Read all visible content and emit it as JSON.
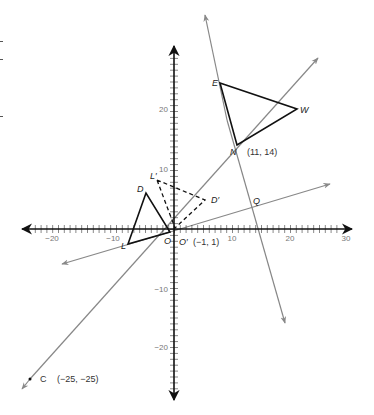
{
  "diagram": {
    "type": "coordinate-plane-transformations",
    "colors": {
      "axis": "#111111",
      "ray": "#888888",
      "triangle": "#111111",
      "dashed_triangle": "#111111",
      "tick_label": "#777777",
      "label": "#222222"
    },
    "axes": {
      "x_ticks": [
        {
          "value": -20,
          "label": "−20"
        },
        {
          "value": -10,
          "label": "−10"
        },
        {
          "value": 10,
          "label": "10"
        },
        {
          "value": 20,
          "label": "20"
        },
        {
          "value": 30,
          "label": "30"
        }
      ],
      "y_ticks": [
        {
          "value": 20,
          "label": "20"
        },
        {
          "value": 10,
          "label": "10"
        },
        {
          "value": -10,
          "label": "−10"
        },
        {
          "value": -20,
          "label": "−20"
        }
      ]
    },
    "points": {
      "E": {
        "label": "E"
      },
      "W": {
        "label": "W"
      },
      "N": {
        "label": "N",
        "coords": "(11, 14)"
      },
      "Q": {
        "label": "Q"
      },
      "D": {
        "label": "D"
      },
      "L": {
        "label": "L"
      },
      "O": {
        "label": "O"
      },
      "D_prime": {
        "label": "D′"
      },
      "L_prime": {
        "label": "L′"
      },
      "O_prime": {
        "label": "O′",
        "coords": "(−1, 1)"
      },
      "C": {
        "label": "C",
        "coords": "(−25, −25)"
      }
    },
    "shapes": [
      {
        "name": "triangle-ENW",
        "vertices": [
          "E",
          "N",
          "W"
        ],
        "style": "solid"
      },
      {
        "name": "triangle-DLO",
        "vertices": [
          "D",
          "L",
          "O"
        ],
        "style": "solid"
      },
      {
        "name": "triangle-D'L'O'",
        "vertices": [
          "D′",
          "L′",
          "O′"
        ],
        "style": "dashed"
      }
    ],
    "rays": [
      {
        "name": "ray-C-through-O-N",
        "from": "C",
        "through": "N"
      },
      {
        "name": "line-through-E-N-Q",
        "through": [
          "E",
          "N",
          "Q"
        ]
      },
      {
        "name": "line-through-L-O-Q",
        "through": [
          "L",
          "O",
          "Q"
        ]
      }
    ]
  }
}
